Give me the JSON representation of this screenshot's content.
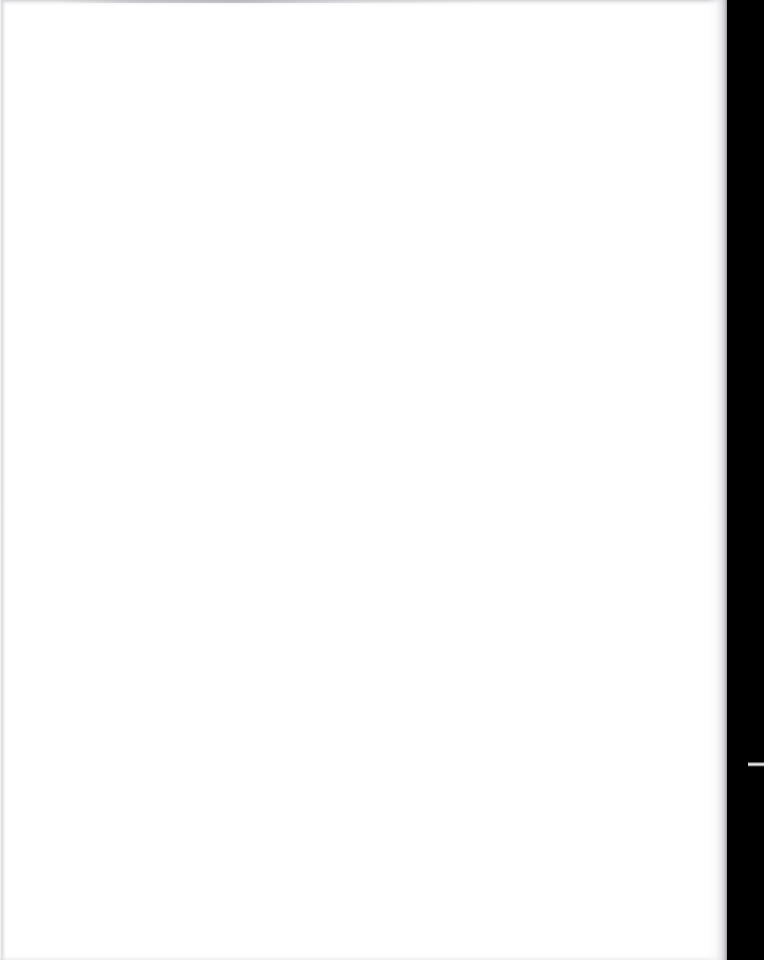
{
  "document": {
    "type": "scanned-page",
    "page_content_text": "",
    "page_note": "blank scanned page — no visible text, headings, figures or marks"
  },
  "canvas": {
    "width_px": 764,
    "height_px": 960,
    "background_color": "#ffffff"
  },
  "page_sheet": {
    "label": "scanned page sheet",
    "left_px": 0,
    "top_px": 0,
    "width_px": 727,
    "height_px": 960,
    "paper_color": "#ffffff"
  },
  "scanner_bed": {
    "label": "scanner bed margin",
    "left_px": 727,
    "top_px": 0,
    "width_px": 37,
    "height_px": 960,
    "color": "#000000"
  },
  "artifacts": {
    "dash": {
      "label": "scan artifact dash",
      "left_px": 748,
      "top_px": 762,
      "width_px": 16,
      "height_px": 5,
      "color": "#f4f4f4"
    },
    "edge_top": {
      "label": "top scan edge streak",
      "color": "#9a9aa0"
    },
    "edge_left": {
      "label": "left scan edge line",
      "color": "#cdcdd2"
    },
    "edge_bottom": {
      "label": "bottom scan edge",
      "color": "#dedee2"
    },
    "page_edge_shadow": {
      "label": "page edge shadow",
      "color": "#96969e"
    }
  }
}
